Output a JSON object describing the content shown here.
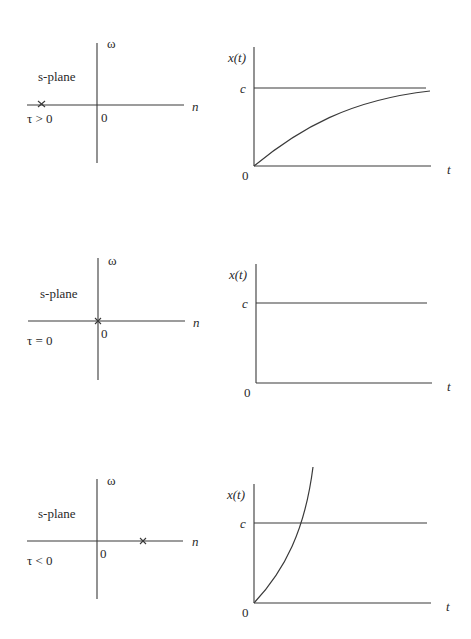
{
  "rows": [
    {
      "plane": {
        "title": "s-plane",
        "imag_axis": "ω",
        "real_axis": "n",
        "origin": "0",
        "condition": "τ > 0",
        "pole_marker": "×",
        "pole_position": "left of origin (negative real)"
      },
      "response": {
        "ylabel": "x(t)",
        "xlabel": "t",
        "origin": "0",
        "level": "c",
        "behavior": "rises exponentially and approaches c"
      }
    },
    {
      "plane": {
        "title": "s-plane",
        "imag_axis": "ω",
        "real_axis": "n",
        "origin": "0",
        "condition": "τ = 0",
        "pole_marker": "×",
        "pole_position": "at origin"
      },
      "response": {
        "ylabel": "x(t)",
        "xlabel": "t",
        "origin": "0",
        "level": "c",
        "behavior": "constant at c"
      }
    },
    {
      "plane": {
        "title": "s-plane",
        "imag_axis": "ω",
        "real_axis": "n",
        "origin": "0",
        "condition": "τ < 0",
        "pole_marker": "×",
        "pole_position": "right of origin (positive real)"
      },
      "response": {
        "ylabel": "x(t)",
        "xlabel": "t",
        "origin": "0",
        "level": "c",
        "behavior": "grows exponentially without bound, crossing c"
      }
    }
  ],
  "colors": {
    "ink": "#3a3a3a",
    "background": "#ffffff"
  }
}
